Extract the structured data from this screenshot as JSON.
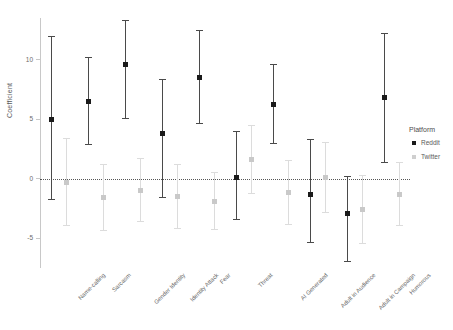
{
  "chart_data": {
    "type": "scatter",
    "title": "",
    "xlabel": "",
    "ylabel": "Coefficient",
    "ylim": [
      -7.5,
      13.5
    ],
    "yticks": [
      10,
      5,
      0,
      -5
    ],
    "ytick_labels": [
      "10",
      "5",
      "0",
      "-5"
    ],
    "grid": false,
    "reference_line": 0,
    "legend_title": "Platform",
    "legend_position": "right",
    "categories": [
      "Name-calling",
      "Sarcasm",
      "Gender Identity",
      "Identity Attack",
      "Fear",
      "Threat",
      "AI Generated",
      "Adult in Audience",
      "Adult in Campaign",
      "Humorous"
    ],
    "series": [
      {
        "name": "Reddit",
        "color": "#1a1a1a",
        "values": [
          5.0,
          6.5,
          9.6,
          3.8,
          8.5,
          0.1,
          6.2,
          -1.3,
          -2.9,
          6.8
        ],
        "ci_low": [
          -1.8,
          2.8,
          5.0,
          -1.6,
          4.6,
          -3.5,
          2.9,
          -5.4,
          -7.0,
          1.3
        ],
        "ci_high": [
          12.0,
          10.2,
          13.3,
          8.4,
          12.5,
          4.0,
          9.6,
          3.3,
          0.2,
          12.2
        ]
      },
      {
        "name": "Twitter",
        "color": "#cfcfcf",
        "values": [
          -0.3,
          -1.6,
          -1.0,
          -1.5,
          -1.9,
          1.6,
          -1.2,
          0.1,
          -2.6,
          -1.3
        ],
        "ci_low": [
          -4.0,
          -4.4,
          -3.6,
          -4.2,
          -4.3,
          -1.3,
          -3.9,
          -2.9,
          -5.5,
          -4.0
        ],
        "ci_high": [
          3.4,
          1.2,
          1.7,
          1.2,
          0.6,
          4.5,
          1.6,
          3.1,
          0.3,
          1.4
        ]
      }
    ]
  },
  "legend": {
    "title": "Platform",
    "items": [
      {
        "label": "Reddit",
        "key": "reddit"
      },
      {
        "label": "Twitter",
        "key": "twitter"
      }
    ]
  },
  "axes": {
    "y_title": "Coefficient"
  }
}
